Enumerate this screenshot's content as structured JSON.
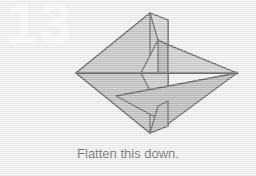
{
  "step": {
    "number": "13",
    "caption": "Flatten this down."
  },
  "colors": {
    "background": "#efefef",
    "face_main": "#a8a8a8",
    "face_light": "#c2c2c2",
    "face_dark": "#8f8f8f",
    "face_shadow": "#9a9a9a",
    "outline": "#111111",
    "crease_dashed": "#1a1a1a",
    "crease_dotted": "#1a1a1a",
    "step_number": "#fbfbfb",
    "caption_text": "#232323"
  },
  "diagram": {
    "vertices": {
      "left_point": [
        76,
        73
      ],
      "right_point": [
        237,
        73
      ],
      "top_point": [
        150,
        13
      ],
      "bottom_point": [
        150,
        133
      ],
      "flap_top_right": [
        168,
        20
      ],
      "flap_bottom_right": [
        168,
        126
      ],
      "inner_notch": [
        141,
        73
      ]
    },
    "creases": [
      {
        "name": "valley-fold-dashed",
        "style": "dashed",
        "from": [
          116,
          96
        ],
        "to": [
          237,
          73
        ]
      },
      {
        "name": "reference-line-dotted",
        "style": "dotted",
        "from": [
          158,
          40
        ],
        "to": [
          237,
          73
        ]
      },
      {
        "name": "horizontal-centerline",
        "style": "solid",
        "from": [
          76,
          73
        ],
        "to": [
          237,
          73
        ]
      }
    ]
  }
}
